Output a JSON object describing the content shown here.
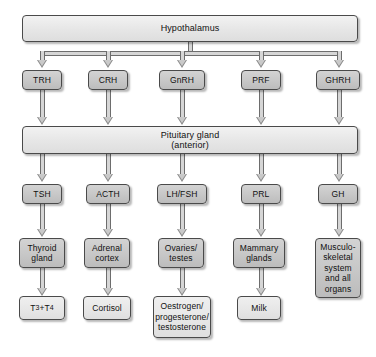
{
  "diagram": {
    "colors": {
      "background": "#ffffff",
      "banner_fill": "#ececec",
      "gray_fill": "#c9c9c9",
      "light_fill": "#e9e9e9",
      "border": "#4a4a4a",
      "connector": "#6d6d6d",
      "arrow": "#8a8a8a"
    },
    "levels": {
      "level1_label": "Hypothalamus",
      "level3_label": "Pituitary gland\n(anterior)"
    },
    "columns": [
      {
        "releasing_hormone": "TRH",
        "pituitary_hormone": "TSH",
        "target_organ": "Thyroid\ngland",
        "product": "T3+T4",
        "product_html": "T<sub>3</sub>+T<sub>4</sub>"
      },
      {
        "releasing_hormone": "CRH",
        "pituitary_hormone": "ACTH",
        "target_organ": "Adrenal\ncortex",
        "product": "Cortisol",
        "product_html": "Cortisol"
      },
      {
        "releasing_hormone": "GnRH",
        "pituitary_hormone": "LH/FSH",
        "target_organ": "Ovaries/\ntestes",
        "product": "Oestrogen/\nprogesterone/\ntestosterone",
        "product_html": "Oestrogen/<br>progesterone/<br>testosterone"
      },
      {
        "releasing_hormone": "PRF",
        "pituitary_hormone": "PRL",
        "target_organ": "Mammary\nglands",
        "product": "Milk",
        "product_html": "Milk"
      },
      {
        "releasing_hormone": "GHRH",
        "pituitary_hormone": "GH",
        "target_organ": "Musculo-\nskeletal\nsystem\nand all\norgans",
        "product": "",
        "product_html": ""
      }
    ]
  }
}
